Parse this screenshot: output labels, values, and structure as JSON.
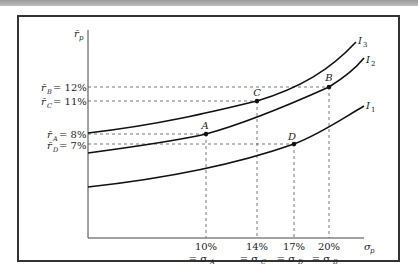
{
  "chart_data": {
    "type": "line",
    "title": "",
    "xlabel": "σ_p",
    "ylabel": "r̄_p",
    "grid": false,
    "legend": "none",
    "series": [
      {
        "name": "I1",
        "description": "lowest indifference curve",
        "points": [
          {
            "label": "D",
            "sigma": 17,
            "return": 7
          }
        ]
      },
      {
        "name": "I2",
        "description": "middle indifference curve",
        "points": [
          {
            "label": "A",
            "sigma": 10,
            "return": 8
          },
          {
            "label": "B",
            "sigma": 20,
            "return": 12
          }
        ]
      },
      {
        "name": "I3",
        "description": "highest indifference curve",
        "points": [
          {
            "label": "C",
            "sigma": 14,
            "return": 11
          }
        ]
      }
    ],
    "points": [
      {
        "label": "A",
        "sigma": 10,
        "return": 8,
        "curve": "I2"
      },
      {
        "label": "C",
        "sigma": 14,
        "return": 11,
        "curve": "I3"
      },
      {
        "label": "D",
        "sigma": 17,
        "return": 7,
        "curve": "I1"
      },
      {
        "label": "B",
        "sigma": 20,
        "return": 12,
        "curve": "I2"
      }
    ],
    "y_tick_labels": [
      "r̄_B = 12%",
      "r̄_C = 11%",
      "r̄_A = 8%",
      "r̄_D = 7%"
    ],
    "x_tick_labels": [
      {
        "value": "10%",
        "sub": "= σ_A"
      },
      {
        "value": "14%",
        "sub": "= σ_C"
      },
      {
        "value": "17%",
        "sub": "= σ_D"
      },
      {
        "value": "20%",
        "sub": "= σ_B"
      }
    ],
    "curve_labels": [
      "I3",
      "I2",
      "I1"
    ]
  },
  "labels": {
    "y_axis": "r̄",
    "y_axis_sub": "p",
    "x_axis": "σ",
    "x_axis_sub": "p",
    "yticks": [
      {
        "r": "r̄",
        "sub": "B",
        "eq": "= 12%"
      },
      {
        "r": "r̄",
        "sub": "C",
        "eq": "= 11%"
      },
      {
        "r": "r̄",
        "sub": "A",
        "eq": "= 8%"
      },
      {
        "r": "r̄",
        "sub": "D",
        "eq": "= 7%"
      }
    ],
    "xticks": [
      {
        "pct": "10%",
        "eq": "= σ",
        "sub": "A"
      },
      {
        "pct": "14%",
        "eq": "= σ",
        "sub": "C"
      },
      {
        "pct": "17%",
        "eq": "= σ",
        "sub": "D"
      },
      {
        "pct": "20%",
        "eq": "= σ",
        "sub": "B"
      }
    ],
    "points": {
      "A": "A",
      "B": "B",
      "C": "C",
      "D": "D"
    },
    "curves": {
      "I3": "I",
      "I3_sub": "3",
      "I2": "I",
      "I2_sub": "2",
      "I1": "I",
      "I1_sub": "1"
    }
  }
}
